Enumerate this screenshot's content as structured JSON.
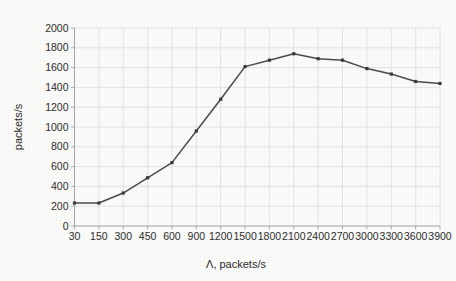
{
  "chart_data": {
    "type": "line",
    "title": "",
    "xlabel": "Λ, packets/s",
    "ylabel": "packets/s",
    "x_tick_labels": [
      "30",
      "150",
      "300",
      "450",
      "600",
      "900",
      "1200",
      "1500",
      "1800",
      "2100",
      "2400",
      "2700",
      "3000",
      "3300",
      "3600",
      "3900"
    ],
    "y_tick_labels": [
      "0",
      "200",
      "400",
      "600",
      "800",
      "1000",
      "1200",
      "1400",
      "1600",
      "1800",
      "2000"
    ],
    "ylim": [
      0,
      2000
    ],
    "y_tick_step": 200,
    "grid": true,
    "legend": "none",
    "x": [
      30,
      150,
      300,
      450,
      600,
      900,
      1200,
      1500,
      1800,
      2100,
      2400,
      2700,
      3000,
      3300,
      3600,
      3900
    ],
    "values": [
      232,
      232,
      333,
      487,
      640,
      960,
      1280,
      1610,
      1675,
      1740,
      1690,
      1675,
      1590,
      1535,
      1460,
      1440
    ],
    "series": [
      {
        "name": "throughput",
        "values": [
          232,
          232,
          333,
          487,
          640,
          960,
          1280,
          1610,
          1675,
          1740,
          1690,
          1675,
          1590,
          1535,
          1460,
          1440
        ]
      }
    ],
    "line_color": "#4a4a4a",
    "marker_color": "#3a3a3a",
    "marker_shape": "square",
    "grid_color": "#d9d9dd",
    "background_color": "#fbfbfa"
  }
}
